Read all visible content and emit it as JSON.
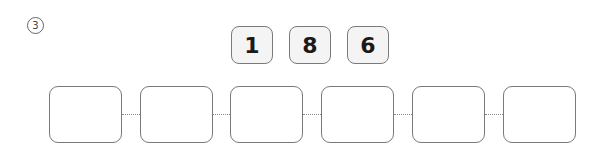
{
  "question_number": "3",
  "digit_tiles": [
    "1",
    "8",
    "6"
  ],
  "answer_boxes": [
    "",
    "",
    "",
    "",
    "",
    ""
  ],
  "colors": {
    "tile_fill": "#f4f4f4",
    "border": "#7a7a7a",
    "connector": "#888888"
  }
}
